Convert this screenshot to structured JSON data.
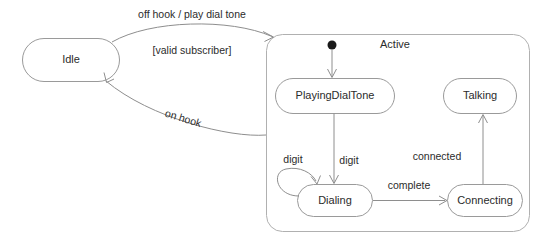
{
  "diagram": {
    "type": "uml-state-machine",
    "colors": {
      "background": "#ffffff",
      "state_stroke": "#9a9a9a",
      "composite_stroke": "#b0b0b0",
      "edge_stroke": "#8e8e8e",
      "text": "#2b2b2b",
      "initial_dot": "#1a1a1a"
    },
    "states": [
      {
        "id": "idle",
        "label": "Idle",
        "kind": "simple",
        "x": 22,
        "y": 38,
        "w": 98,
        "h": 44
      },
      {
        "id": "active",
        "label": "Active",
        "kind": "composite",
        "x": 266,
        "y": 34,
        "w": 264,
        "h": 198
      },
      {
        "id": "playing_dial_tone",
        "label": "PlayingDialTone",
        "kind": "simple",
        "x": 275,
        "y": 78,
        "w": 120,
        "h": 36
      },
      {
        "id": "talking",
        "label": "Talking",
        "kind": "simple",
        "x": 443,
        "y": 78,
        "w": 74,
        "h": 36
      },
      {
        "id": "dialing",
        "label": "Dialing",
        "kind": "simple",
        "x": 297,
        "y": 184,
        "w": 76,
        "h": 33
      },
      {
        "id": "connecting",
        "label": "Connecting",
        "kind": "simple",
        "x": 447,
        "y": 184,
        "w": 76,
        "h": 33
      }
    ],
    "initial_pseudostate": {
      "id": "active-initial",
      "cx": 332,
      "cy": 45,
      "r": 4.5
    },
    "transitions": [
      {
        "id": "idle-to-active",
        "from": "idle",
        "to": "active",
        "labels": [
          "off hook / play dial tone",
          "[valid subscriber]"
        ]
      },
      {
        "id": "active-to-idle",
        "from": "active",
        "to": "idle",
        "labels": [
          "on hook"
        ]
      },
      {
        "id": "initial-to-playingdialtone",
        "from": "active-initial",
        "to": "playing_dial_tone",
        "labels": []
      },
      {
        "id": "playingdialtone-to-dialing",
        "from": "playing_dial_tone",
        "to": "dialing",
        "labels": [
          "digit"
        ]
      },
      {
        "id": "dialing-self-loop",
        "from": "dialing",
        "to": "dialing",
        "labels": [
          "digit"
        ]
      },
      {
        "id": "dialing-to-connecting",
        "from": "dialing",
        "to": "connecting",
        "labels": [
          "complete"
        ]
      },
      {
        "id": "connecting-to-talking",
        "from": "connecting",
        "to": "talking",
        "labels": [
          "connected"
        ]
      }
    ],
    "labels": {
      "idle": "Idle",
      "active": "Active",
      "playing_dial_tone": "PlayingDialTone",
      "talking": "Talking",
      "dialing": "Dialing",
      "connecting": "Connecting",
      "off_hook": "off hook / play dial tone",
      "valid_subscriber": "[valid subscriber]",
      "on_hook": "on hook",
      "digit_loop": "digit",
      "digit_down": "digit",
      "complete": "complete",
      "connected": "connected"
    }
  }
}
